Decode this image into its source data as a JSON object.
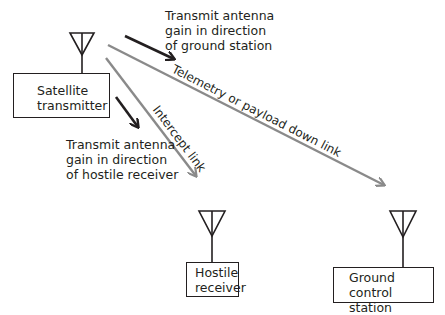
{
  "nodes": {
    "satellite": {
      "line1": "Satellite",
      "line2": "transmitter"
    },
    "hostile": {
      "line1": "Hostile",
      "line2": "receiver"
    },
    "ground": {
      "line1": "Ground",
      "line2": "control station"
    }
  },
  "annotations": {
    "gain_ground": {
      "line1": "Transmit antenna",
      "line2": "gain in direction",
      "line3": "of ground station"
    },
    "gain_hostile": {
      "line1": "Transmit antenna",
      "line2": "gain in direction",
      "line3": "of hostile receiver"
    }
  },
  "links": {
    "downlink": "Telemetry or payload down link",
    "intercept": "Intercept link"
  },
  "colors": {
    "link": "#8a8a8a",
    "gain_arrow": "#231f20",
    "outline": "#231f20"
  }
}
